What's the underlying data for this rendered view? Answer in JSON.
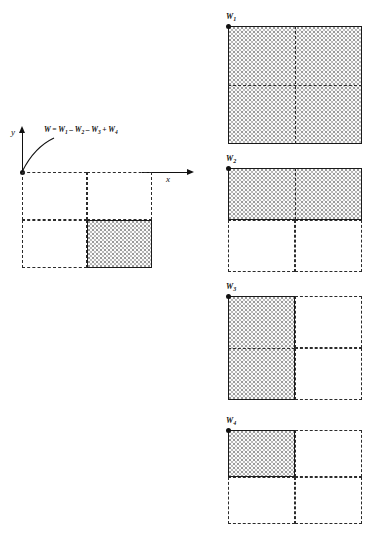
{
  "figure": {
    "type": "geometry-decomposition-diagram",
    "formula": {
      "text": "W = W1 - W2 - W3 + W4",
      "lhs": "W",
      "equals": "=",
      "term1": "W",
      "term1_sub": "1",
      "op1": "–",
      "term2": "W",
      "term2_sub": "2",
      "op2": "–",
      "term3": "W",
      "term3_sub": "3",
      "op3": "+",
      "term4": "W",
      "term4_sub": "4"
    },
    "axes": {
      "x_label": "x",
      "y_label": "y",
      "origin_label": ""
    },
    "colors": {
      "stroke": "#1a1a1a",
      "dashed_stroke": "#2b2b2b",
      "shade_fill": "#fbfbfb",
      "shade_dots": "#9a9a9a",
      "background": "#ffffff"
    },
    "main_panel": {
      "name": "main-diagram",
      "shaded_quadrant": "bottom-right",
      "grid_divisions": {
        "columns": 2,
        "rows": 2
      }
    },
    "panels": [
      {
        "id": "w1",
        "label": "W",
        "subscript": "1",
        "shaded_region": "full",
        "sign": "+",
        "caption": "W1"
      },
      {
        "id": "w2",
        "label": "W",
        "subscript": "2",
        "shaded_region": "top-half",
        "sign": "–",
        "caption": "W2"
      },
      {
        "id": "w3",
        "label": "W",
        "subscript": "3",
        "shaded_region": "left-half",
        "sign": "–",
        "caption": "W3"
      },
      {
        "id": "w4",
        "label": "W",
        "subscript": "4",
        "shaded_region": "top-left-quadrant",
        "sign": "+",
        "caption": "W4"
      }
    ]
  }
}
